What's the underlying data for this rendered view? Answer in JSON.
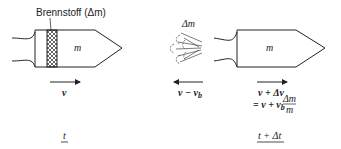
{
  "left_state": {
    "fuel_label": "Brennstoff (Δm)",
    "mass_label": "m",
    "velocity_label": "v",
    "time_label": "t"
  },
  "right_state": {
    "ejected_mass_label": "Δm",
    "mass_label": "m",
    "exhaust_velocity_label": "v − v",
    "exhaust_velocity_sub": "b",
    "velocity_line1": "v + Δv",
    "velocity_line2_prefix": "= v + v",
    "velocity_line2_sub": "b",
    "fraction_num": "Δm",
    "fraction_den": "m",
    "time_label": "t + Δt"
  },
  "colors": {
    "stroke": "#222222",
    "background": "#ffffff"
  }
}
